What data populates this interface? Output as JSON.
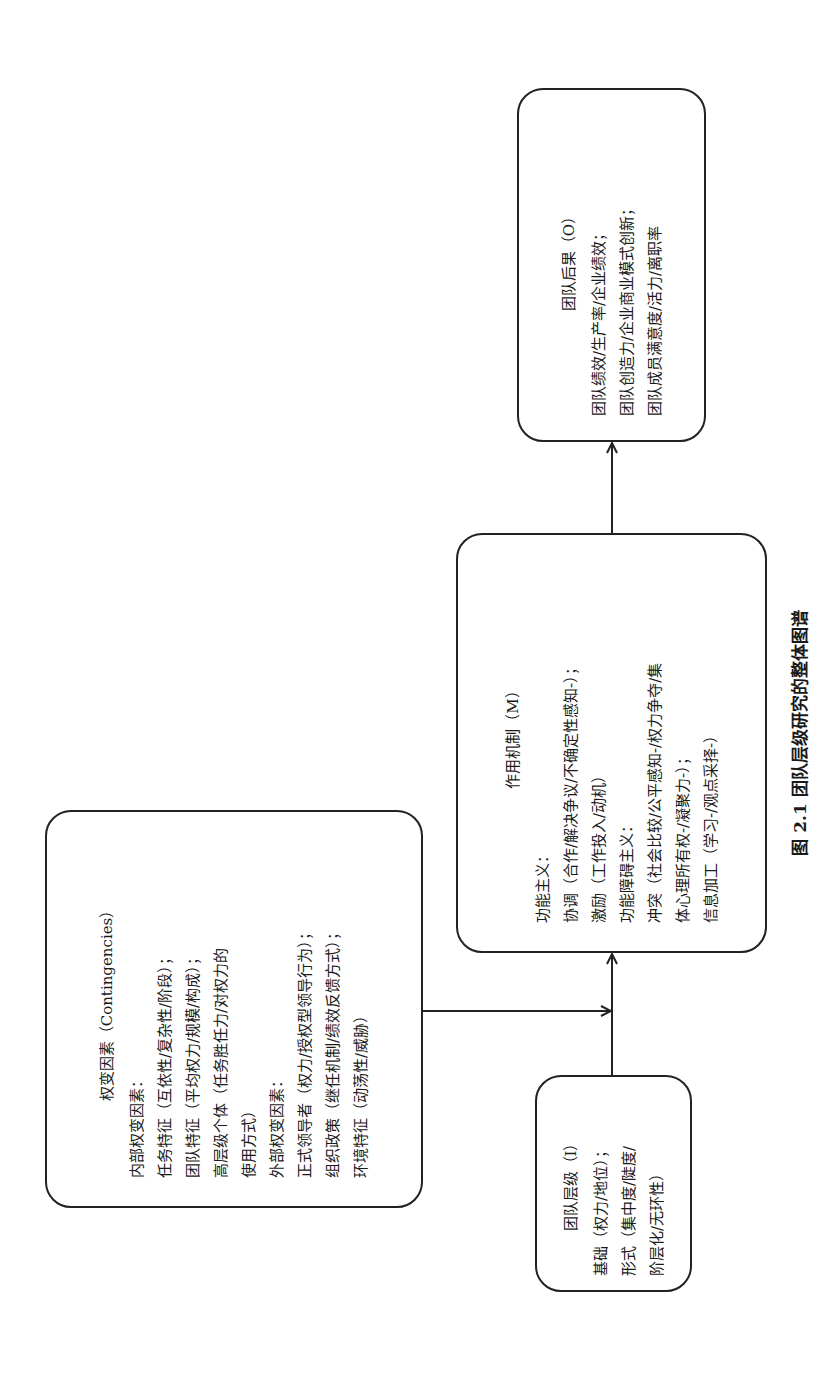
{
  "diagram": {
    "orientation": "rotated-90-ccw",
    "caption": "图 2.1   团队层级研究的整体图谱",
    "boxes": {
      "hierarchy": {
        "title": "团队层级（I）",
        "lines": [
          "基础（权力/地位）；",
          "形式（集中度/陡度/",
          "阶层化/无环性）"
        ]
      },
      "contingencies": {
        "title": "权变因素（Contingencies）",
        "lines": [
          "内部权变因素：",
          "任务特征（互依性/复杂性/阶段）；",
          "团队特征（平均权力/规模/构成）；",
          "高层级个体（任务胜任力/对权力的",
          "使用方式）",
          "外部权变因素：",
          "正式领导者（权力/授权型领导行为）；",
          "组织政策（继任机制/绩效反馈方式）；",
          "环境特征（动荡性/威胁）"
        ]
      },
      "mechanism": {
        "title": "作用机制（M）",
        "lines": [
          "功能主义：",
          "协调（合作/解决争议/不确定性感知-）；",
          "激励（工作投入/动机）",
          "功能障碍主义：",
          "冲突（社会比较/公平感知-/权力争夺/集",
          "体心理所有权-/凝聚力-）；",
          "信息加工（学习-/观点采择-）"
        ]
      },
      "outcomes": {
        "title": "团队后果（O）",
        "lines": [
          "团队绩效/生产率/企业绩效；",
          "团队创造力/企业商业模式创新；",
          "团队成员满意度/活力/离职率"
        ]
      }
    },
    "edges": [
      {
        "from": "团队层级（I）",
        "to": "作用机制（M）"
      },
      {
        "from": "权变因素（Contingencies）",
        "to": "I→M link (moderation)"
      },
      {
        "from": "作用机制（M）",
        "to": "团队后果（O）"
      }
    ],
    "colors": {
      "stroke": "#222222",
      "text": "#1a1a1a",
      "background": "#ffffff"
    }
  }
}
